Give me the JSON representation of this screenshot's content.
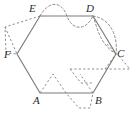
{
  "figure": {
    "type": "geometry-diagram",
    "canvas": {
      "width": 137,
      "height": 116
    },
    "colors": {
      "background": "#ffffff",
      "solid_stroke": "#7b7b7b",
      "dashed_stroke": "#8c8c8c",
      "label_text": "#2b2b2b"
    },
    "shape": {
      "name": "hexagon",
      "sides": 6,
      "vertices": [
        {
          "label": "A",
          "x": 40,
          "y": 93
        },
        {
          "label": "B",
          "x": 93,
          "y": 93
        },
        {
          "label": "C",
          "x": 116,
          "y": 54
        },
        {
          "label": "D",
          "x": 93,
          "y": 16
        },
        {
          "label": "E",
          "x": 40,
          "y": 16
        },
        {
          "label": "F",
          "x": 17,
          "y": 54
        }
      ],
      "edges": [
        {
          "from": "A",
          "to": "B"
        },
        {
          "from": "B",
          "to": "C"
        },
        {
          "from": "C",
          "to": "D"
        },
        {
          "from": "D",
          "to": "E"
        },
        {
          "from": "E",
          "to": "F"
        },
        {
          "from": "F",
          "to": "A"
        }
      ]
    },
    "dashed_overlays": [
      {
        "name": "wave-over-ED",
        "on_edge": "D-E",
        "style": "wave",
        "description": "dashed S-curve crossing the top edge between E and D"
      },
      {
        "name": "arc-outside-DC",
        "on_edge": "D-C",
        "style": "arc",
        "description": "dashed lens/arc bulging outward from the D-C edge"
      },
      {
        "name": "parallelogram-inside-CB",
        "on_edge": "C-B",
        "style": "parallelogram",
        "description": "dashed parallelogram straddling the C-B edge"
      },
      {
        "name": "triangle-outside-EF",
        "on_edge": "E-F",
        "style": "triangle",
        "description": "dashed triangle outside the E-F edge"
      },
      {
        "name": "zigzag-over-AB",
        "on_edge": "A-B",
        "style": "zigzag",
        "description": "dashed zigzag crossing the bottom edge between A and B"
      }
    ],
    "labels": {
      "A": "A",
      "B": "B",
      "C": "C",
      "D": "D",
      "E": "E",
      "F": "F"
    }
  }
}
